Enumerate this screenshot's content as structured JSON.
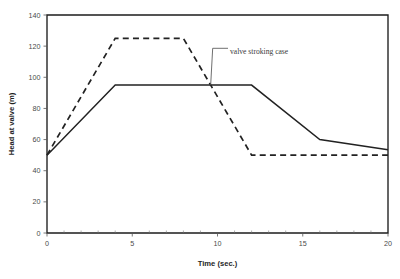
{
  "chart_data": {
    "type": "line",
    "title": "",
    "xlabel": "Time (sec.)",
    "ylabel": "Head at valve (m)",
    "xlim": [
      0,
      20
    ],
    "ylim": [
      0,
      140
    ],
    "xticks": [
      0,
      5,
      10,
      15,
      20
    ],
    "xtick_labels": [
      "0",
      "5",
      "10",
      "15",
      "20"
    ],
    "xminor_tick_step": 1,
    "yticks": [
      0,
      20,
      40,
      60,
      80,
      100,
      120,
      140
    ],
    "ytick_labels": [
      "0",
      "20",
      "40",
      "60",
      "80",
      "100",
      "120",
      "140"
    ],
    "grid": false,
    "legend_position": "none",
    "series": [
      {
        "name": "rapid closure case",
        "style": "dashed",
        "color": "#222222",
        "x": [
          0,
          4,
          8,
          12,
          20
        ],
        "values": [
          50,
          125,
          125,
          50,
          50
        ]
      },
      {
        "name": "valve stroking case",
        "style": "solid",
        "color": "#222222",
        "x": [
          0,
          4,
          12,
          16,
          20
        ],
        "values": [
          50,
          95,
          95,
          60,
          53.5
        ]
      }
    ],
    "annotations": [
      {
        "text": "valve stroking case",
        "x": 9.6,
        "y": 117,
        "points_to_x": 9.6,
        "points_to_y": 95
      }
    ]
  },
  "axes": {
    "x_title": "Time (sec.)",
    "y_title": "Head at valve (m)"
  }
}
